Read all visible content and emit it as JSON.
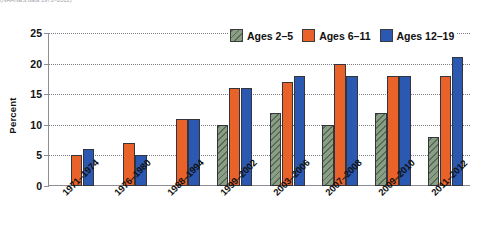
{
  "caption": {
    "truncated_note": "(NHANES data 1971–2012)"
  },
  "chart_data": {
    "type": "bar",
    "title": "",
    "subtitle": "",
    "xlabel": "",
    "ylabel": "Percent",
    "ylim": [
      0,
      25
    ],
    "yticks": [
      0,
      5,
      10,
      15,
      20,
      25
    ],
    "grid": true,
    "legend_position": "top-right",
    "categories": [
      "1971–1974",
      "1976–1980",
      "1988–1994",
      "1999–2002",
      "2003–2006",
      "2007–2008",
      "2009–2010",
      "2011–2012"
    ],
    "series": [
      {
        "name": "Ages 2–5",
        "color": "#8a9e85",
        "pattern": "diagonal-hatch",
        "values": [
          null,
          null,
          null,
          10,
          12,
          10,
          12,
          8
        ]
      },
      {
        "name": "Ages 6–11",
        "color": "#e8622a",
        "pattern": "solid",
        "values": [
          5,
          7,
          11,
          16,
          17,
          20,
          18,
          18
        ]
      },
      {
        "name": "Ages 12–19",
        "color": "#2b58b0",
        "pattern": "solid",
        "values": [
          6,
          5,
          11,
          16,
          18,
          18,
          18,
          21
        ]
      }
    ]
  }
}
